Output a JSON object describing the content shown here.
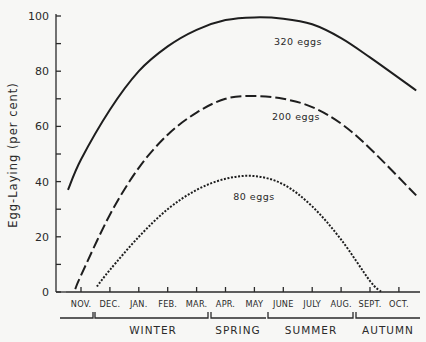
{
  "chart_data": {
    "type": "line",
    "title": "",
    "xlabel": "",
    "ylabel": "Egg-Laying (per cent)",
    "ylim": [
      0,
      100
    ],
    "yticks": [
      0,
      20,
      40,
      60,
      80,
      100
    ],
    "grid": false,
    "legend_position": "inline labels",
    "categories": [
      "Nov.",
      "Dec.",
      "Jan.",
      "Feb.",
      "Mar.",
      "Apr.",
      "May",
      "June",
      "July",
      "Aug.",
      "Sept.",
      "Oct."
    ],
    "seasons": [
      {
        "label": "Winter",
        "months": [
          "Dec.",
          "Jan.",
          "Feb."
        ]
      },
      {
        "label": "Spring",
        "months": [
          "Mar.",
          "Apr.",
          "May"
        ]
      },
      {
        "label": "Summer",
        "months": [
          "June",
          "July",
          "Aug."
        ]
      },
      {
        "label": "Autumn",
        "months": [
          "Sept.",
          "Oct."
        ]
      }
    ],
    "series": [
      {
        "name": "320 eggs",
        "style": "solid",
        "x": [
          -0.45,
          0,
          1,
          2,
          3,
          4,
          5,
          6,
          7,
          8,
          9,
          10,
          11.6
        ],
        "values": [
          37,
          48,
          66,
          80,
          89,
          95,
          98.5,
          99.5,
          99,
          97,
          92,
          85,
          73
        ]
      },
      {
        "name": "200 eggs",
        "style": "dashed",
        "x": [
          -0.2,
          0,
          1,
          2,
          3,
          4,
          5,
          6,
          7,
          8,
          9,
          10,
          11.6
        ],
        "values": [
          1,
          6,
          28,
          45,
          57,
          65,
          70,
          71,
          70,
          67,
          61,
          52,
          35
        ]
      },
      {
        "name": "80 eggs",
        "style": "dotted",
        "x": [
          0.55,
          1,
          2,
          3,
          4,
          5,
          6,
          7,
          8,
          9,
          10,
          10.4
        ],
        "values": [
          2,
          8,
          20,
          30,
          37,
          41,
          42,
          39,
          31,
          19,
          4,
          0
        ]
      }
    ]
  },
  "axis": {
    "y_label": "Egg-Laying (per cent)",
    "y_ticks": [
      "0",
      "20",
      "40",
      "60",
      "80",
      "100"
    ]
  },
  "months": [
    "Nov.",
    "Dec.",
    "Jan.",
    "Feb.",
    "Mar.",
    "Apr.",
    "May",
    "June",
    "July",
    "Aug.",
    "Sept.",
    "Oct."
  ],
  "seasons": [
    "Winter",
    "Spring",
    "Summer",
    "Autumn"
  ],
  "series_labels": [
    "320 eggs",
    "200 eggs",
    "80 eggs"
  ],
  "colors": {
    "ink": "#1e1e1e",
    "paper": "#f7f7f5"
  }
}
